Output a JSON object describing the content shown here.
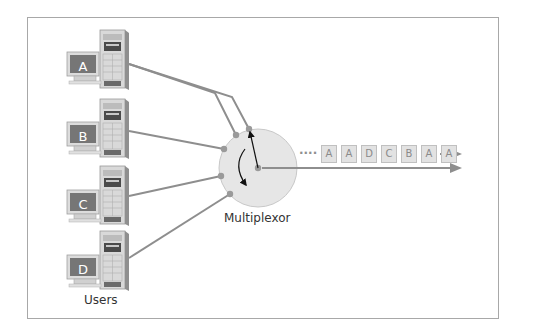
{
  "diagram": {
    "title": "",
    "users_label": "Users",
    "multiplexor_label": "Multiplexor",
    "users": [
      {
        "id": "A",
        "label": "A"
      },
      {
        "id": "B",
        "label": "B"
      },
      {
        "id": "C",
        "label": "C"
      },
      {
        "id": "D",
        "label": "D"
      }
    ],
    "stream": {
      "ellipsis": "....",
      "packets": [
        "A",
        "A",
        "D",
        "C",
        "B",
        "A",
        "A"
      ]
    },
    "colors": {
      "line": "#8e8e8e",
      "circle_fill": "#e6e6e6",
      "circle_stroke": "#c4c4c4",
      "packet_fill": "#e2e2e2",
      "packet_stroke": "#bdbdbd",
      "packet_text": "#8a8a8a",
      "screen": "#7a7a7a",
      "tower": "#d8d8d8"
    }
  }
}
